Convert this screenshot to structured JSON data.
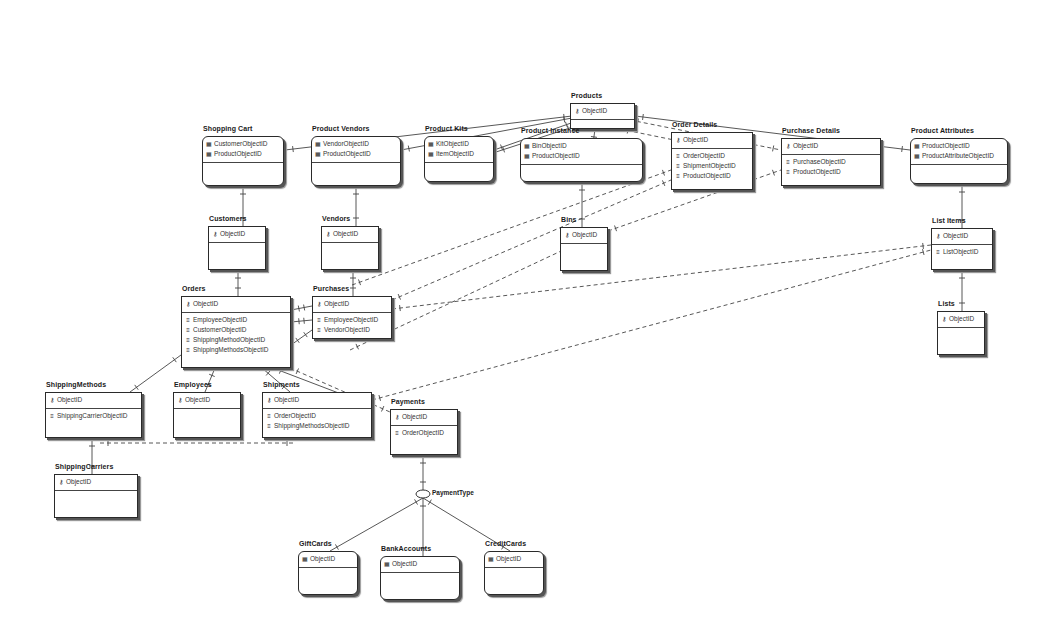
{
  "diagram": {
    "type": "entity-relationship",
    "entities": [
      {
        "id": "products",
        "title": "Products",
        "x": 570,
        "y": 103,
        "w": 65,
        "h": 26,
        "rounded": false,
        "pk": [
          {
            "icon": "key",
            "name": "ObjectID"
          }
        ],
        "attrs": []
      },
      {
        "id": "shopping_cart",
        "title": "Shopping Cart",
        "x": 202,
        "y": 136,
        "w": 82,
        "h": 50,
        "rounded": true,
        "pk": [
          {
            "icon": "ent",
            "name": "CustomerObjectID"
          },
          {
            "icon": "ent",
            "name": "ProductObjectID"
          }
        ],
        "attrs": []
      },
      {
        "id": "product_vendors",
        "title": "Product Vendors",
        "x": 311,
        "y": 136,
        "w": 90,
        "h": 50,
        "rounded": true,
        "pk": [
          {
            "icon": "ent",
            "name": "VendorObjectID"
          },
          {
            "icon": "ent",
            "name": "ProductObjectID"
          }
        ],
        "attrs": []
      },
      {
        "id": "product_kits",
        "title": "Product Kits",
        "x": 424,
        "y": 136,
        "w": 70,
        "h": 46,
        "rounded": true,
        "pk": [
          {
            "icon": "ent",
            "name": "KitObjectID"
          },
          {
            "icon": "ent",
            "name": "ItemObjectID"
          }
        ],
        "attrs": []
      },
      {
        "id": "product_instance",
        "title": "Product Instance",
        "x": 520,
        "y": 138,
        "w": 123,
        "h": 44,
        "rounded": true,
        "pk": [
          {
            "icon": "ent",
            "name": "BinObjectID"
          },
          {
            "icon": "ent",
            "name": "ProductObjectID"
          }
        ],
        "attrs": []
      },
      {
        "id": "order_details",
        "title": "Order Details",
        "x": 671,
        "y": 132,
        "w": 82,
        "h": 58,
        "rounded": false,
        "pk": [
          {
            "icon": "key",
            "name": "ObjectID"
          }
        ],
        "attrs": [
          {
            "icon": "fkey",
            "name": "OrderObjectID"
          },
          {
            "icon": "fkey",
            "name": "ShipmentObjectID"
          },
          {
            "icon": "fkey",
            "name": "ProductObjectID"
          }
        ]
      },
      {
        "id": "purchase_details",
        "title": "Purchase Details",
        "x": 781,
        "y": 138,
        "w": 100,
        "h": 48,
        "rounded": false,
        "pk": [
          {
            "icon": "key",
            "name": "ObjectID"
          }
        ],
        "attrs": [
          {
            "icon": "fkey",
            "name": "PurchaseObjectID"
          },
          {
            "icon": "fkey",
            "name": "ProductObjectID"
          }
        ]
      },
      {
        "id": "product_attributes",
        "title": "Product Attributes",
        "x": 910,
        "y": 138,
        "w": 98,
        "h": 46,
        "rounded": true,
        "pk": [
          {
            "icon": "ent",
            "name": "ProductObjectID"
          },
          {
            "icon": "ent",
            "name": "ProductAttributeObjectID"
          }
        ],
        "attrs": []
      },
      {
        "id": "customers",
        "title": "Customers",
        "x": 208,
        "y": 226,
        "w": 58,
        "h": 44,
        "rounded": false,
        "pk": [
          {
            "icon": "key",
            "name": "ObjectID"
          }
        ],
        "attrs": []
      },
      {
        "id": "vendors",
        "title": "Vendors",
        "x": 321,
        "y": 226,
        "w": 58,
        "h": 44,
        "rounded": false,
        "pk": [
          {
            "icon": "key",
            "name": "ObjectID"
          }
        ],
        "attrs": []
      },
      {
        "id": "bins",
        "title": "Bins",
        "x": 560,
        "y": 227,
        "w": 48,
        "h": 44,
        "rounded": false,
        "pk": [
          {
            "icon": "key",
            "name": "ObjectID"
          }
        ],
        "attrs": []
      },
      {
        "id": "list_items",
        "title": "List Items",
        "x": 931,
        "y": 228,
        "w": 62,
        "h": 42,
        "rounded": false,
        "pk": [
          {
            "icon": "key",
            "name": "ObjectID"
          }
        ],
        "attrs": [
          {
            "icon": "fkey",
            "name": "ListObjectID"
          }
        ]
      },
      {
        "id": "orders",
        "title": "Orders",
        "x": 181,
        "y": 296,
        "w": 110,
        "h": 72,
        "rounded": false,
        "pk": [
          {
            "icon": "key",
            "name": "ObjectID"
          }
        ],
        "attrs": [
          {
            "icon": "fkey",
            "name": "EmployeeObjectID"
          },
          {
            "icon": "fkey",
            "name": "CustomerObjectID"
          },
          {
            "icon": "fkey",
            "name": "ShippingMethodObjectID"
          },
          {
            "icon": "fkey",
            "name": "ShippingMethodsObjectID"
          }
        ]
      },
      {
        "id": "purchases",
        "title": "Purchases",
        "x": 312,
        "y": 296,
        "w": 80,
        "h": 43,
        "rounded": false,
        "pk": [
          {
            "icon": "key",
            "name": "ObjectID"
          }
        ],
        "attrs": [
          {
            "icon": "fkey",
            "name": "EmployeeObjectID"
          },
          {
            "icon": "fkey",
            "name": "VendorObjectID"
          }
        ]
      },
      {
        "id": "lists",
        "title": "Lists",
        "x": 937,
        "y": 311,
        "w": 48,
        "h": 44,
        "rounded": false,
        "pk": [
          {
            "icon": "key",
            "name": "ObjectID"
          }
        ],
        "attrs": []
      },
      {
        "id": "shipping_methods",
        "title": "ShippingMethods",
        "x": 45,
        "y": 392,
        "w": 97,
        "h": 46,
        "rounded": false,
        "pk": [
          {
            "icon": "key",
            "name": "ObjectID"
          }
        ],
        "attrs": [
          {
            "icon": "fkey",
            "name": "ShippingCarrierObjectID"
          }
        ]
      },
      {
        "id": "employees",
        "title": "Employees",
        "x": 173,
        "y": 392,
        "w": 68,
        "h": 46,
        "rounded": false,
        "pk": [
          {
            "icon": "key",
            "name": "ObjectID"
          }
        ],
        "attrs": []
      },
      {
        "id": "shipments",
        "title": "Shipments",
        "x": 262,
        "y": 392,
        "w": 110,
        "h": 46,
        "rounded": false,
        "pk": [
          {
            "icon": "key",
            "name": "ObjectID"
          }
        ],
        "attrs": [
          {
            "icon": "fkey",
            "name": "OrderObjectID"
          },
          {
            "icon": "fkey",
            "name": "ShippingMethodsObjectID"
          }
        ]
      },
      {
        "id": "payments",
        "title": "Payments",
        "x": 390,
        "y": 409,
        "w": 68,
        "h": 46,
        "rounded": false,
        "pk": [
          {
            "icon": "key",
            "name": "ObjectID"
          }
        ],
        "attrs": [
          {
            "icon": "fkey",
            "name": "OrderObjectID"
          }
        ]
      },
      {
        "id": "shipping_carriers",
        "title": "ShippingCarriers",
        "x": 54,
        "y": 474,
        "w": 84,
        "h": 44,
        "rounded": false,
        "pk": [
          {
            "icon": "key",
            "name": "ObjectID"
          }
        ],
        "attrs": []
      },
      {
        "id": "gift_cards",
        "title": "GiftCards",
        "x": 298,
        "y": 551,
        "w": 60,
        "h": 44,
        "rounded": true,
        "pk": [
          {
            "icon": "ent",
            "name": "ObjectID"
          }
        ],
        "attrs": []
      },
      {
        "id": "bank_accounts",
        "title": "BankAccounts",
        "x": 380,
        "y": 556,
        "w": 80,
        "h": 44,
        "rounded": true,
        "pk": [
          {
            "icon": "ent",
            "name": "ObjectID"
          }
        ],
        "attrs": []
      },
      {
        "id": "credit_cards",
        "title": "CreditCards",
        "x": 484,
        "y": 551,
        "w": 60,
        "h": 44,
        "rounded": true,
        "pk": [
          {
            "icon": "ent",
            "name": "ObjectID"
          }
        ],
        "attrs": []
      }
    ],
    "subtype": {
      "label": "PaymentType",
      "x": 422,
      "y": 494
    },
    "relationships": [
      {
        "from": [
          572,
          116
        ],
        "to": [
          285,
          150
        ],
        "style": "solid"
      },
      {
        "from": [
          572,
          118
        ],
        "to": [
          401,
          150
        ],
        "style": "solid"
      },
      {
        "from": [
          574,
          122
        ],
        "to": [
          494,
          150
        ],
        "style": "solid"
      },
      {
        "from": [
          576,
          126
        ],
        "to": [
          496,
          152
        ],
        "style": "solid"
      },
      {
        "from": [
          595,
          129
        ],
        "to": [
          590,
          166
        ],
        "style": "solid"
      },
      {
        "from": [
          620,
          129
        ],
        "to": [
          684,
          142
        ],
        "style": "dashed"
      },
      {
        "from": [
          630,
          120
        ],
        "to": [
          781,
          150
        ],
        "style": "dashed"
      },
      {
        "from": [
          635,
          116
        ],
        "to": [
          910,
          150
        ],
        "style": "solid"
      },
      {
        "from": [
          243,
          186
        ],
        "to": [
          243,
          226
        ],
        "style": "solid"
      },
      {
        "from": [
          356,
          186
        ],
        "to": [
          356,
          226
        ],
        "style": "solid"
      },
      {
        "from": [
          582,
          182
        ],
        "to": [
          582,
          227
        ],
        "style": "solid"
      },
      {
        "from": [
          962,
          184
        ],
        "to": [
          962,
          228
        ],
        "style": "solid"
      },
      {
        "from": [
          962,
          270
        ],
        "to": [
          962,
          311
        ],
        "style": "solid"
      },
      {
        "from": [
          238,
          270
        ],
        "to": [
          238,
          296
        ],
        "style": "solid"
      },
      {
        "from": [
          353,
          270
        ],
        "to": [
          353,
          296
        ],
        "style": "solid"
      },
      {
        "from": [
          291,
          310
        ],
        "to": [
          312,
          306
        ],
        "style": "solid"
      },
      {
        "from": [
          291,
          322
        ],
        "to": [
          312,
          320
        ],
        "style": "solid"
      },
      {
        "from": [
          291,
          345
        ],
        "to": [
          312,
          330
        ],
        "style": "solid"
      },
      {
        "from": [
          352,
          285
        ],
        "to": [
          671,
          170
        ],
        "style": "dashed"
      },
      {
        "from": [
          392,
          300
        ],
        "to": [
          671,
          180
        ],
        "style": "dashed"
      },
      {
        "from": [
          392,
          309
        ],
        "to": [
          931,
          245
        ],
        "style": "dashed"
      },
      {
        "from": [
          350,
          350
        ],
        "to": [
          608,
          229
        ],
        "style": "dashed"
      },
      {
        "from": [
          608,
          231
        ],
        "to": [
          781,
          170
        ],
        "style": "dashed"
      },
      {
        "from": [
          372,
          400
        ],
        "to": [
          931,
          250
        ],
        "style": "dashed"
      },
      {
        "from": [
          290,
          368
        ],
        "to": [
          390,
          412
        ],
        "style": "dashed"
      },
      {
        "from": [
          181,
          355
        ],
        "to": [
          130,
          392
        ],
        "style": "solid"
      },
      {
        "from": [
          215,
          368
        ],
        "to": [
          205,
          392
        ],
        "style": "solid"
      },
      {
        "from": [
          262,
          368
        ],
        "to": [
          290,
          392
        ],
        "style": "solid"
      },
      {
        "from": [
          273,
          368
        ],
        "to": [
          370,
          405
        ],
        "style": "solid"
      },
      {
        "from": [
          92,
          438
        ],
        "to": [
          92,
          474
        ],
        "style": "solid"
      },
      {
        "from": [
          100,
          443
        ],
        "to": [
          295,
          443
        ],
        "style": "dashed"
      },
      {
        "from": [
          423,
          455
        ],
        "to": [
          423,
          490
        ],
        "style": "solid"
      },
      {
        "from": [
          423,
          498
        ],
        "to": [
          330,
          551
        ],
        "style": "solid"
      },
      {
        "from": [
          423,
          498
        ],
        "to": [
          423,
          556
        ],
        "style": "solid"
      },
      {
        "from": [
          423,
          498
        ],
        "to": [
          510,
          551
        ],
        "style": "solid"
      }
    ]
  }
}
